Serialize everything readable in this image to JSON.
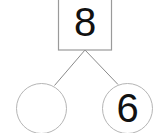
{
  "diagram": {
    "name": "number-bond",
    "type": "number-bond",
    "background_color": "#ffffff",
    "stroke_color": "#a0a0a0",
    "text_color": "#111111",
    "whole": {
      "shape": "rectangle",
      "value": "8",
      "filled": true
    },
    "parts": [
      {
        "position": "left",
        "shape": "circle",
        "value": "",
        "filled": false
      },
      {
        "position": "right",
        "shape": "circle",
        "value": "6",
        "filled": true
      }
    ],
    "connectors": [
      {
        "from": "whole",
        "to": "part-left"
      },
      {
        "from": "whole",
        "to": "part-right"
      }
    ]
  }
}
